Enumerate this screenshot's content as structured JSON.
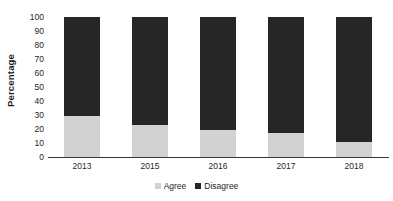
{
  "chart_data": {
    "type": "bar",
    "subtype": "stacked-bar-100",
    "title": "",
    "xlabel": "",
    "ylabel": "Percentage",
    "categories": [
      "2013",
      "2015",
      "2016",
      "2017",
      "2018"
    ],
    "series": [
      {
        "name": "Agree",
        "values": [
          29,
          23,
          19,
          17,
          11
        ],
        "color": "#d2d2d2"
      },
      {
        "name": "Disagree",
        "values": [
          71,
          77,
          81,
          83,
          89
        ],
        "color": "#262626"
      }
    ],
    "ylim": [
      0,
      100
    ],
    "y_ticks": [
      "0",
      "10",
      "20",
      "30",
      "40",
      "50",
      "60",
      "70",
      "80",
      "90",
      "100"
    ],
    "grid": false,
    "legend_position": "bottom",
    "legend_entries": [
      "Agree",
      "Disagree"
    ],
    "annotations": []
  },
  "axes": {
    "y_title": "Percentage",
    "y_tick_labels": [
      "100",
      "90",
      "80",
      "70",
      "60",
      "50",
      "40",
      "30",
      "20",
      "10",
      "0"
    ],
    "x_tick_labels": [
      "2013",
      "2015",
      "2016",
      "2017",
      "2018"
    ]
  },
  "legend": {
    "items": [
      {
        "label": "Agree",
        "color": "#d2d2d2"
      },
      {
        "label": "Disagree",
        "color": "#262626"
      }
    ]
  },
  "colors": {
    "agree": "#d2d2d2",
    "disagree": "#262626",
    "axis": "#3a3a3a",
    "text": "#1f1f1f",
    "background": "#ffffff"
  }
}
